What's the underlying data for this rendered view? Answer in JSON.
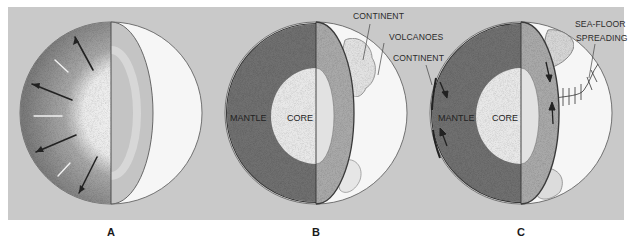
{
  "figure": {
    "background_color": "#c9c9c9",
    "page_color": "#ffffff",
    "panels": [
      {
        "id": "A",
        "letter": "A",
        "labels": []
      },
      {
        "id": "B",
        "letter": "B",
        "labels": {
          "mantle": "MANTLE",
          "core": "CORE",
          "continent_top": "CONTINENT",
          "volcanoes": "VOLCANOES",
          "continent_side": "CONTINENT"
        }
      },
      {
        "id": "C",
        "letter": "C",
        "labels": {
          "mantle": "MANTLE",
          "core": "CORE",
          "sea_floor_line1": "SEA-FLOOR",
          "sea_floor_line2": "SPREADING"
        }
      }
    ]
  },
  "colors": {
    "mantle_dark": "#6e6e6e",
    "mantle_cut": "#a5a5a5",
    "core_light": "#e6e6e6",
    "surface": "#f7f7f7",
    "outline": "#3a3a3a"
  }
}
